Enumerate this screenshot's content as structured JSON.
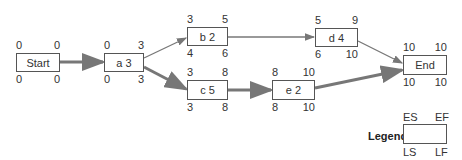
{
  "nodes": [
    {
      "id": "start",
      "label": "Start",
      "es": "0",
      "ef": "0",
      "ls": "0",
      "lf": "0",
      "x": 16,
      "y": 53,
      "w": 44,
      "h": 19
    },
    {
      "id": "a",
      "label": "a 3",
      "es": "0",
      "ef": "3",
      "ls": "0",
      "lf": "3",
      "x": 104,
      "y": 53,
      "w": 40,
      "h": 19
    },
    {
      "id": "b",
      "label": "b 2",
      "es": "3",
      "ef": "5",
      "ls": "4",
      "lf": "6",
      "x": 187,
      "y": 27,
      "w": 41,
      "h": 19
    },
    {
      "id": "c",
      "label": "c 5",
      "es": "3",
      "ef": "8",
      "ls": "3",
      "lf": "8",
      "x": 187,
      "y": 80,
      "w": 41,
      "h": 20
    },
    {
      "id": "d",
      "label": "d 4",
      "es": "5",
      "ef": "9",
      "ls": "6",
      "lf": "10",
      "x": 315,
      "y": 28,
      "w": 43,
      "h": 19
    },
    {
      "id": "e",
      "label": "e 2",
      "es": "8",
      "ef": "10",
      "ls": "8",
      "lf": "10",
      "x": 272,
      "y": 80,
      "w": 43,
      "h": 20
    },
    {
      "id": "end",
      "label": "End",
      "es": "10",
      "ef": "10",
      "ls": "10",
      "lf": "10",
      "x": 403,
      "y": 55,
      "w": 44,
      "h": 20
    }
  ],
  "edges": [
    {
      "from": "start",
      "to": "a",
      "critical": true
    },
    {
      "from": "a",
      "to": "b",
      "critical": false
    },
    {
      "from": "a",
      "to": "c",
      "critical": true
    },
    {
      "from": "b",
      "to": "d",
      "critical": false
    },
    {
      "from": "c",
      "to": "e",
      "critical": true
    },
    {
      "from": "d",
      "to": "end",
      "critical": false
    },
    {
      "from": "e",
      "to": "end",
      "critical": true
    }
  ],
  "legend": {
    "title": "Legend:",
    "es": "ES",
    "ef": "EF",
    "ls": "LS",
    "lf": "LF"
  },
  "colors": {
    "critical": "#777777",
    "normal": "#777777",
    "border": "#555555"
  }
}
